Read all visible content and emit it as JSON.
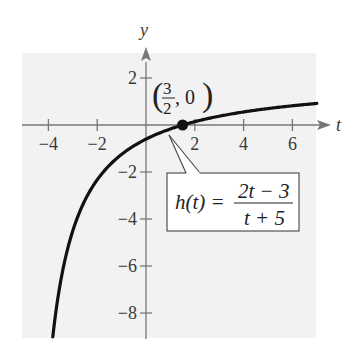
{
  "chart_data": {
    "type": "line",
    "title": "",
    "xlabel": "t",
    "ylabel": "y",
    "xlim": [
      -5,
      7
    ],
    "ylim": [
      -9,
      3.5
    ],
    "grid": false,
    "background": "#f2f2f2",
    "x_ticks": [
      -4,
      -2,
      2,
      4,
      6
    ],
    "y_ticks": [
      2,
      -2,
      -4,
      -6,
      -8
    ],
    "x_tick_labels": [
      "−4",
      "−2",
      "2",
      "4",
      "6"
    ],
    "y_tick_labels": [
      "2",
      "−2",
      "−4",
      "−6",
      "−8"
    ],
    "series": [
      {
        "name": "h(t) = (2t − 3)/(t + 5)",
        "function": "(2t-3)/(t+5)",
        "domain": [
          -3.82,
          7
        ],
        "color": "#111111"
      }
    ],
    "annotations": [
      {
        "type": "point",
        "x": 1.5,
        "y": 0,
        "label_num": "3",
        "label_den": "2",
        "label_rest": ", 0"
      },
      {
        "type": "callout",
        "text_lhs": "h(t) =",
        "text_num": "2t − 3",
        "text_den": "t + 5"
      }
    ]
  }
}
